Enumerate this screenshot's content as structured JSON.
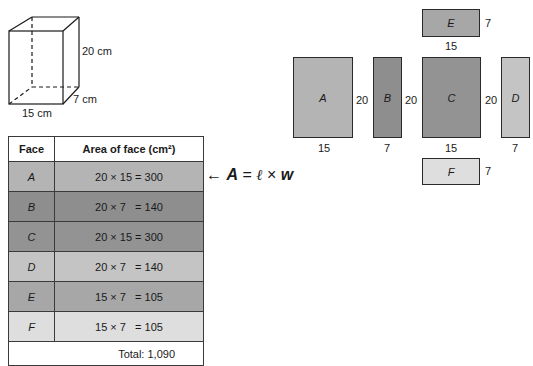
{
  "prism": {
    "height_label": "20 cm",
    "depth_label": "7 cm",
    "width_label": "15 cm"
  },
  "table": {
    "headers": [
      "Face",
      "Area of face (cm²)"
    ],
    "rows": [
      {
        "face": "A",
        "area": "20 × 15 = 300",
        "color": "#b4b4b4"
      },
      {
        "face": "B",
        "area": "20 × 7   = 140",
        "color": "#8e8e8e"
      },
      {
        "face": "C",
        "area": "20 × 15 = 300",
        "color": "#939393"
      },
      {
        "face": "D",
        "area": "20 × 7   = 140",
        "color": "#c4c4c4"
      },
      {
        "face": "E",
        "area": "15 × 7   = 105",
        "color": "#a7a7a7"
      },
      {
        "face": "F",
        "area": "15 × 7   = 105",
        "color": "#dedede"
      }
    ],
    "total": "Total: 1,090"
  },
  "formula": {
    "arrow": "←",
    "A": "A",
    "eq": "=",
    "l": "ℓ",
    "times": "×",
    "w": "w"
  },
  "net": {
    "faces": {
      "A": {
        "label": "A",
        "width": "15",
        "height": "20",
        "color": "#b4b4b4"
      },
      "B": {
        "label": "B",
        "width": "7",
        "height": "20",
        "color": "#8e8e8e"
      },
      "C": {
        "label": "C",
        "width": "15",
        "height": "20",
        "color": "#939393"
      },
      "D": {
        "label": "D",
        "width": "7",
        "height": "20",
        "color": "#c4c4c4"
      },
      "E": {
        "label": "E",
        "width": "15",
        "height": "7",
        "color": "#a7a7a7"
      },
      "F": {
        "label": "F",
        "width": "15",
        "height": "7",
        "color": "#dedede"
      }
    }
  }
}
